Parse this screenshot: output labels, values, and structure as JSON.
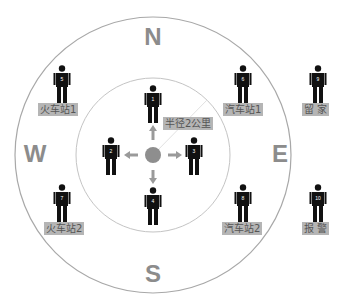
{
  "compass": {
    "north": "N",
    "south": "S",
    "west": "W",
    "east": "E"
  },
  "circles": {
    "outer": {
      "cx": 153,
      "cy": 155,
      "r": 138,
      "color": "#a8a8a8"
    },
    "inner": {
      "cx": 153,
      "cy": 155,
      "r": 77,
      "color": "#bdbdbd"
    },
    "center_dot_color": "#8e8e8e",
    "arrow_color": "#9a9a9a"
  },
  "persons": [
    {
      "id": "1",
      "number": "1"
    },
    {
      "id": "2",
      "number": "2"
    },
    {
      "id": "3",
      "number": "3"
    },
    {
      "id": "4",
      "number": "4"
    },
    {
      "id": "5",
      "number": "5"
    },
    {
      "id": "6",
      "number": "6"
    },
    {
      "id": "7",
      "number": "7"
    },
    {
      "id": "8",
      "number": "8"
    },
    {
      "id": "9",
      "number": "9"
    },
    {
      "id": "10",
      "number": "10"
    }
  ],
  "labels": {
    "radius": "半径2公里",
    "train_station_1": "火车站1",
    "train_station_2": "火车站2",
    "bus_station_1": "汽车站1",
    "bus_station_2": "汽车站2",
    "stay_home": "留  家",
    "report_police": "报  警"
  }
}
